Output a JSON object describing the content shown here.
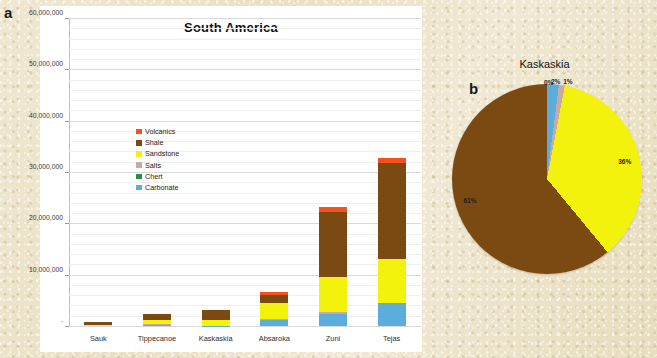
{
  "figure": {
    "panel_a_letter": "a",
    "panel_b_letter": "b"
  },
  "colors": {
    "volcanics": "#F4511E",
    "shale": "#7B4A12",
    "sandstone": "#F2F20D",
    "salts": "#C9A8A8",
    "chert": "#2E8B45",
    "carbonate": "#5BAEDC",
    "grid": "#D9D9D9",
    "plot_bg": "#FFFFFF",
    "paper": "#EFE7D1"
  },
  "chart_data": [
    {
      "type": "bar",
      "id": "south-america-stacked-bar",
      "title": "South America",
      "xlabel": "",
      "ylabel": "",
      "stacked": true,
      "grid": true,
      "legend_position": "inside-upper-left",
      "ylim": [
        0,
        60000000
      ],
      "yticks": [
        0,
        10000000,
        20000000,
        30000000,
        40000000,
        50000000,
        60000000
      ],
      "ytick_labels": [
        "-",
        "10,000,000",
        "20,000,000",
        "30,000,000",
        "40,000,000",
        "50,000,000",
        "60,000,000"
      ],
      "categories": [
        "Sauk",
        "Tippecanoe",
        "Kaskaskia",
        "Absaroka",
        "Zuni",
        "Tejas"
      ],
      "series": [
        {
          "name": "Carbonate",
          "color_key": "carbonate",
          "values": [
            0,
            250000,
            100000,
            1150000,
            2300000,
            4400000
          ]
        },
        {
          "name": "Chert",
          "color_key": "chert",
          "values": [
            0,
            0,
            0,
            0,
            0,
            0
          ]
        },
        {
          "name": "Salts",
          "color_key": "salts",
          "values": [
            0,
            100000,
            0,
            250000,
            500000,
            150000
          ]
        },
        {
          "name": "Sandstone",
          "color_key": "sandstone",
          "values": [
            250000,
            900000,
            1100000,
            3000000,
            6700000,
            8600000
          ]
        },
        {
          "name": "Shale",
          "color_key": "shale",
          "values": [
            550000,
            1050000,
            1900000,
            1700000,
            12700000,
            18600000
          ]
        },
        {
          "name": "Volcanics",
          "color_key": "volcanics",
          "values": [
            0,
            0,
            0,
            450000,
            1000000,
            900000
          ]
        }
      ],
      "totals": [
        800000,
        2300000,
        3100000,
        6550000,
        23200000,
        32650000
      ],
      "legend": [
        {
          "label": "Volcanics",
          "color_key": "volcanics"
        },
        {
          "label": "Shale",
          "color_key": "shale"
        },
        {
          "label": "Sandstone",
          "color_key": "sandstone"
        },
        {
          "label": "Salts",
          "color_key": "salts"
        },
        {
          "label": "Chert",
          "color_key": "chert"
        },
        {
          "label": "Carbonate",
          "color_key": "carbonate"
        }
      ]
    },
    {
      "type": "pie",
      "id": "kaskaskia-pie",
      "title": "Kaskaskia",
      "start_angle_deg": 0,
      "slices": [
        {
          "label": "0%",
          "value": 0,
          "color_key": "volcanics",
          "label_angle_deg": 1,
          "label_radius": 1.02
        },
        {
          "label": "2%",
          "value": 2,
          "color_key": "carbonate",
          "label_angle_deg": 5,
          "label_radius": 1.04
        },
        {
          "label": "1%",
          "value": 1,
          "color_key": "salts",
          "label_angle_deg": 12,
          "label_radius": 1.06
        },
        {
          "label": "36%",
          "value": 36,
          "color_key": "sandstone",
          "label_angle_deg": 77,
          "label_radius": 0.84
        },
        {
          "label": "61%",
          "value": 61,
          "color_key": "shale",
          "label_angle_deg": 255,
          "label_radius": 0.84
        }
      ]
    }
  ]
}
